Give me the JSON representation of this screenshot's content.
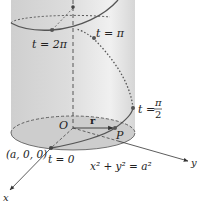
{
  "figure": {
    "colors": {
      "cylinder_fill": "#d9d9d9",
      "cylinder_highlight": "#f2f2f2",
      "base_fill": "#cfcfcf",
      "curve": "#555555",
      "axis": "#333333",
      "point": "#555555",
      "text": "#222222"
    },
    "labels": {
      "t_2pi": "t = 2π",
      "t_pi": "t = π",
      "t_pi2_prefix": "t =",
      "t_pi2_num": "π",
      "t_pi2_den": "2",
      "t_zero": "t = 0",
      "origin": "O",
      "vector_r": "r",
      "point_p": "P",
      "point_a00": "(a, 0, 0)",
      "equation": "x² + y² = a²",
      "axis_x": "x",
      "axis_y": "y"
    }
  }
}
